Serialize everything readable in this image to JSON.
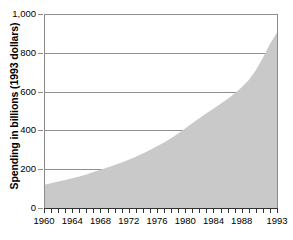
{
  "chart_data": {
    "type": "area",
    "title": "",
    "xlabel": "",
    "ylabel": "Spending in billions (1993 dollars)",
    "xlim": [
      1960,
      1993
    ],
    "ylim": [
      0,
      1000
    ],
    "grid": true,
    "legend": "none",
    "series_color": "#c9c9c9",
    "x_tick_labels": [
      "1960",
      "1964",
      "1968",
      "1972",
      "1976",
      "1980",
      "1984",
      "1988",
      "1993"
    ],
    "x_tick_values": [
      1960,
      1964,
      1968,
      1972,
      1976,
      1980,
      1984,
      1988,
      1993
    ],
    "y_tick_labels": [
      "0",
      "200",
      "400",
      "600",
      "800",
      "1,000"
    ],
    "y_tick_values": [
      0,
      200,
      400,
      600,
      800,
      1000
    ],
    "x": [
      1960,
      1961,
      1962,
      1963,
      1964,
      1965,
      1966,
      1967,
      1968,
      1969,
      1970,
      1971,
      1972,
      1973,
      1974,
      1975,
      1976,
      1977,
      1978,
      1979,
      1980,
      1981,
      1982,
      1983,
      1984,
      1985,
      1986,
      1987,
      1988,
      1989,
      1990,
      1991,
      1992,
      1993
    ],
    "values": [
      120,
      128,
      136,
      144,
      153,
      162,
      173,
      185,
      197,
      209,
      222,
      235,
      249,
      264,
      281,
      299,
      318,
      338,
      360,
      384,
      410,
      437,
      463,
      488,
      512,
      537,
      562,
      590,
      622,
      660,
      710,
      775,
      845,
      905
    ],
    "series": [
      {
        "name": "Spending",
        "values": [
          120,
          128,
          136,
          144,
          153,
          162,
          173,
          185,
          197,
          209,
          222,
          235,
          249,
          264,
          281,
          299,
          318,
          338,
          360,
          384,
          410,
          437,
          463,
          488,
          512,
          537,
          562,
          590,
          622,
          660,
          710,
          775,
          845,
          905
        ]
      }
    ],
    "annotations": []
  },
  "figure": {
    "y_axis_title": "Spending in billions (1993 dollars)",
    "caption": ""
  }
}
